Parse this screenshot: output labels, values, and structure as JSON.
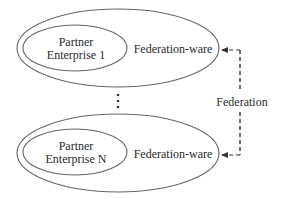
{
  "diagram": {
    "colors": {
      "stroke": "#555555",
      "text": "#2a2a2a",
      "background": "#ffffff"
    },
    "enterprises": [
      {
        "partner_line1": "Partner",
        "partner_line2": "Enterprise 1",
        "middleware_label": "Federation-ware"
      },
      {
        "partner_line1": "Partner",
        "partner_line2": "Enterprise N",
        "middleware_label": "Federation-ware"
      }
    ],
    "ellipsis_glyph": "⋮",
    "federation_label": "Federation",
    "connector": {
      "style": "dashed",
      "arrowheads": "both-ends-pointing-left-into-federation-ware"
    }
  }
}
